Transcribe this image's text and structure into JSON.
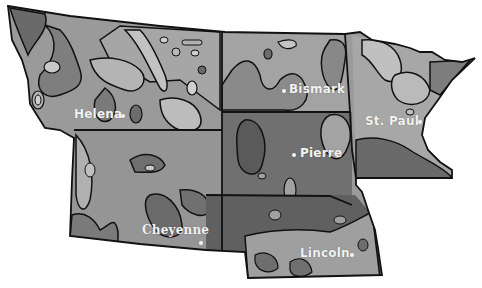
{
  "map": {
    "type": "grayscale contour map",
    "region": "Northern Plains states",
    "states": [
      "Montana",
      "Wyoming",
      "North Dakota",
      "South Dakota",
      "Nebraska",
      "Minnesota"
    ],
    "tones": {
      "lightest": "#bdbdbd",
      "light": "#a4a4a4",
      "medium": "#8a8a8a",
      "dark": "#6d6d6d",
      "darkest": "#555555",
      "outline": "#111111",
      "label": "#f2f2f2"
    }
  },
  "cities": [
    {
      "name": "Helena",
      "x": 74,
      "y": 108
    },
    {
      "name": "Bismark",
      "x": 290,
      "y": 84
    },
    {
      "name": "St. Paul",
      "x": 366,
      "y": 116
    },
    {
      "name": "Pierre",
      "x": 300,
      "y": 148
    },
    {
      "name": "Cheyenne",
      "x": 142,
      "y": 225
    },
    {
      "name": "Lincoln",
      "x": 300,
      "y": 248
    }
  ]
}
